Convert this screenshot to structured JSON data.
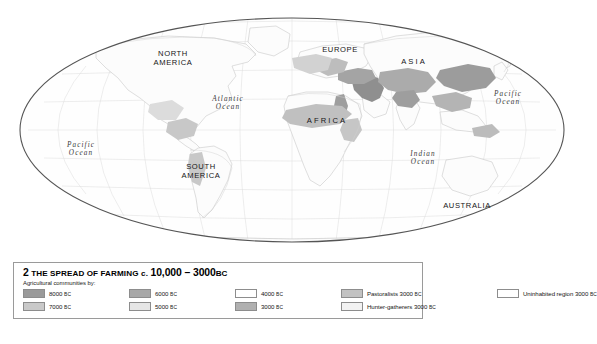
{
  "map": {
    "projection": "elliptical-world",
    "continent_labels": [
      {
        "name": "north-america",
        "text": "NORTH\nAMERICA",
        "x": 173,
        "y": 58,
        "spaced": false
      },
      {
        "name": "south-america",
        "text": "SOUTH\nAMERICA",
        "x": 201,
        "y": 171,
        "spaced": false
      },
      {
        "name": "europe",
        "text": "EUROPE",
        "x": 340,
        "y": 50,
        "spaced": false
      },
      {
        "name": "asia",
        "text": "ASIA",
        "x": 414,
        "y": 62,
        "spaced": true
      },
      {
        "name": "africa",
        "text": "AFRICA",
        "x": 327,
        "y": 121,
        "spaced": true
      },
      {
        "name": "australia",
        "text": "AUSTRALIA",
        "x": 467,
        "y": 206,
        "spaced": false
      }
    ],
    "ocean_labels": [
      {
        "name": "pacific-ocean-west",
        "line1": "Pacific",
        "line2": "Ocean",
        "x": 81,
        "y": 149
      },
      {
        "name": "atlantic-ocean",
        "line1": "Atlantic",
        "line2": "Ocean",
        "x": 228,
        "y": 103
      },
      {
        "name": "pacific-ocean-east",
        "line1": "Pacific",
        "line2": "Ocean",
        "x": 508,
        "y": 98
      },
      {
        "name": "indian-ocean",
        "line1": "Indian",
        "line2": "Ocean",
        "x": 423,
        "y": 158
      }
    ],
    "colors": {
      "outline": "#4a4a4a",
      "graticule": "#d8d8d8",
      "coastline": "#bdbdbd",
      "ocean": "#ffffff",
      "shade_8000": "#9a9a9a",
      "shade_7000": "#c9c9c9",
      "shade_6000": "#a8a8a8",
      "shade_5000": "#e6e6e6",
      "shade_4000": "#ffffff",
      "shade_3000": "#b0b0b0",
      "pastoralists": "#c2c2c2",
      "hunter_gatherers": "#f2f2f2",
      "uninhabited": "#ffffff"
    }
  },
  "legend": {
    "number": "2",
    "title_caps": "THE SPREAD OF FARMING",
    "title_mid": "c.",
    "title_range": "10,000 – 3000",
    "title_era": "BC",
    "subtitle": "Agricultural communities by:",
    "entries": [
      {
        "name": "legend-8000bc",
        "label": "8000",
        "era": "BC",
        "color": "#9a9a9a",
        "col": 0,
        "row": 0
      },
      {
        "name": "legend-7000bc",
        "label": "7000",
        "era": "BC",
        "color": "#c9c9c9",
        "col": 0,
        "row": 1
      },
      {
        "name": "legend-6000bc",
        "label": "6000",
        "era": "BC",
        "color": "#a8a8a8",
        "col": 1,
        "row": 0
      },
      {
        "name": "legend-5000bc",
        "label": "5000",
        "era": "BC",
        "color": "#e6e6e6",
        "col": 1,
        "row": 1
      },
      {
        "name": "legend-4000bc",
        "label": "4000",
        "era": "BC",
        "color": "#ffffff",
        "col": 2,
        "row": 0
      },
      {
        "name": "legend-3000bc",
        "label": "3000",
        "era": "BC",
        "color": "#b0b0b0",
        "col": 2,
        "row": 1
      },
      {
        "name": "legend-pastoralists",
        "label": "Pastoralists 3000",
        "era": "BC",
        "color": "#c2c2c2",
        "col": 3,
        "row": 0
      },
      {
        "name": "legend-hunter-gatherers",
        "label": "Hunter-gatherers 3000",
        "era": "BC",
        "color": "#f2f2f2",
        "col": 3,
        "row": 1
      },
      {
        "name": "legend-uninhabited",
        "label": "Uninhabited region 3000",
        "era": "BC",
        "color": "#ffffff",
        "col": 4,
        "row": 0
      }
    ],
    "column_x": [
      0,
      106,
      212,
      318,
      474
    ],
    "row_y": [
      0,
      13
    ]
  }
}
